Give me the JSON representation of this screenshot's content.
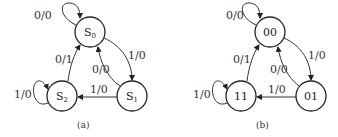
{
  "diagrams": [
    {
      "id": "a",
      "caption": "(a)",
      "states": [
        {
          "name": "S",
          "sub": "0",
          "cx": 90,
          "cy": 32
        },
        {
          "name": "S",
          "sub": "1",
          "cx": 132,
          "cy": 96
        },
        {
          "name": "S",
          "sub": "2",
          "cx": 62,
          "cy": 96
        }
      ],
      "transitions": [
        {
          "from": "S0",
          "to": "S0",
          "label": "0/0"
        },
        {
          "from": "S0",
          "to": "S1",
          "label": "1/0"
        },
        {
          "from": "S1",
          "to": "S0",
          "label": "0/0"
        },
        {
          "from": "S1",
          "to": "S2",
          "label": "1/0"
        },
        {
          "from": "S2",
          "to": "S0",
          "label": "0/1"
        },
        {
          "from": "S2",
          "to": "S2",
          "label": "1/0"
        }
      ]
    },
    {
      "id": "b",
      "caption": "(b)",
      "states": [
        {
          "name": "00",
          "cx": 270,
          "cy": 32
        },
        {
          "name": "01",
          "cx": 311,
          "cy": 96
        },
        {
          "name": "11",
          "cx": 241,
          "cy": 96
        }
      ],
      "transitions": [
        {
          "from": "00",
          "to": "00",
          "label": "0/0"
        },
        {
          "from": "00",
          "to": "01",
          "label": "1/0"
        },
        {
          "from": "01",
          "to": "00",
          "label": "0/0"
        },
        {
          "from": "01",
          "to": "11",
          "label": "1/0"
        },
        {
          "from": "11",
          "to": "00",
          "label": "0/1"
        },
        {
          "from": "11",
          "to": "11",
          "label": "1/0"
        }
      ]
    }
  ]
}
